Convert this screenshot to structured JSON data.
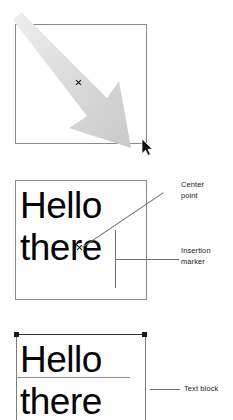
{
  "figure": {
    "background": "#ffffff",
    "ink": "#050505",
    "rule_color": "#8a8a8a"
  },
  "panels": [
    {
      "id": "drag",
      "name": "drag-to-create-text-box",
      "frame": {
        "x": 15,
        "y": 24,
        "width": 132,
        "height": 120
      },
      "arrow": {
        "label": "drag-arrow",
        "from": {
          "x": 0,
          "y": 0
        },
        "to": {
          "x": 128,
          "y": 116
        },
        "color": "#d2d2d2"
      },
      "center_point": {
        "x": 78,
        "y": 82,
        "glyph": "x"
      },
      "cursor": {
        "x": 143,
        "y": 140,
        "glyph": "arrow-pointer"
      }
    },
    {
      "id": "text",
      "name": "text-with-center-and-insertion",
      "frame": {
        "x": 15,
        "y": 180,
        "width": 132,
        "height": 120
      },
      "text_lines": [
        "Hello",
        "there"
      ],
      "center_point": {
        "x": 79,
        "y": 247,
        "glyph": "x"
      },
      "insertion_marker": {
        "x": 115,
        "y": 230,
        "height": 58
      },
      "callouts": [
        {
          "name": "center-point",
          "label": "Center\npoint",
          "x": 181,
          "y": 180
        },
        {
          "name": "insertion-marker",
          "label": "Insertion\nmarker",
          "x": 181,
          "y": 245
        }
      ]
    },
    {
      "id": "block",
      "name": "text-block-selection",
      "selection_box": {
        "x": 16,
        "y": 334,
        "width": 130,
        "height": 86
      },
      "handles": [
        {
          "name": "handle-top-left",
          "x": 14,
          "y": 332
        },
        {
          "name": "handle-top-right",
          "x": 142,
          "y": 332
        }
      ],
      "text_lines": [
        "Hello",
        "there"
      ],
      "callouts": [
        {
          "name": "text-block",
          "label": "Text block",
          "x": 184,
          "y": 384
        }
      ]
    }
  ]
}
